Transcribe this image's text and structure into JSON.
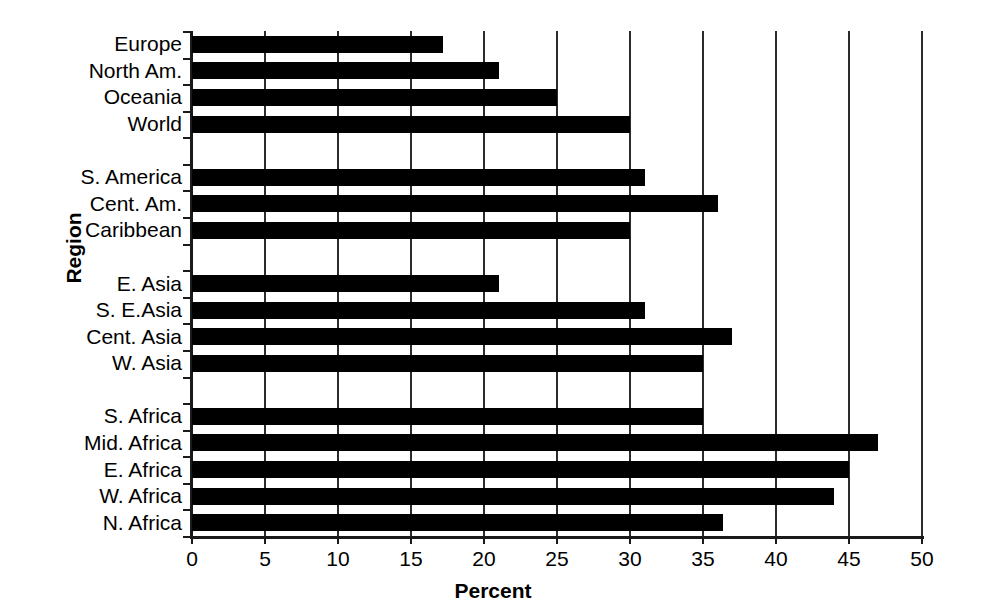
{
  "chart_data": {
    "type": "bar",
    "orientation": "horizontal",
    "title": "",
    "xlabel": "Percent",
    "ylabel": "Region",
    "xlim": [
      0,
      50
    ],
    "xticks": [
      0,
      5,
      10,
      15,
      20,
      25,
      30,
      35,
      40,
      45,
      50
    ],
    "xtick_labels": [
      "0",
      "5",
      "10",
      "15",
      "20",
      "25",
      "30",
      "35",
      "40",
      "45",
      "50"
    ],
    "grid": "vertical",
    "legend": "none",
    "bar_color": "#000000",
    "axis_color": "#1a1a1a",
    "categories": [
      "Europe",
      "North  Am.",
      "Oceania",
      "World",
      "",
      "S. America",
      "Cent. Am.",
      "Caribbean",
      "",
      "E. Asia",
      "S. E.Asia",
      "Cent. Asia",
      "W. Asia",
      "",
      "S. Africa",
      "Mid. Africa",
      "E. Africa",
      "W. Africa",
      "N. Africa"
    ],
    "values": [
      17.2,
      21.0,
      25.0,
      30.0,
      null,
      31.0,
      36.0,
      30.0,
      null,
      21.0,
      31.0,
      37.0,
      35.0,
      null,
      35.0,
      47.0,
      45.0,
      44.0,
      36.4
    ],
    "groups": [
      {
        "name": "Global",
        "categories": [
          "Europe",
          "North  Am.",
          "Oceania",
          "World"
        ]
      },
      {
        "name": "Americas",
        "categories": [
          "S. America",
          "Cent. Am.",
          "Caribbean"
        ]
      },
      {
        "name": "Asia",
        "categories": [
          "E. Asia",
          "S. E.Asia",
          "Cent. Asia",
          "W. Asia"
        ]
      },
      {
        "name": "Africa",
        "categories": [
          "S. Africa",
          "Mid. Africa",
          "E. Africa",
          "W. Africa",
          "N. Africa"
        ]
      }
    ]
  }
}
